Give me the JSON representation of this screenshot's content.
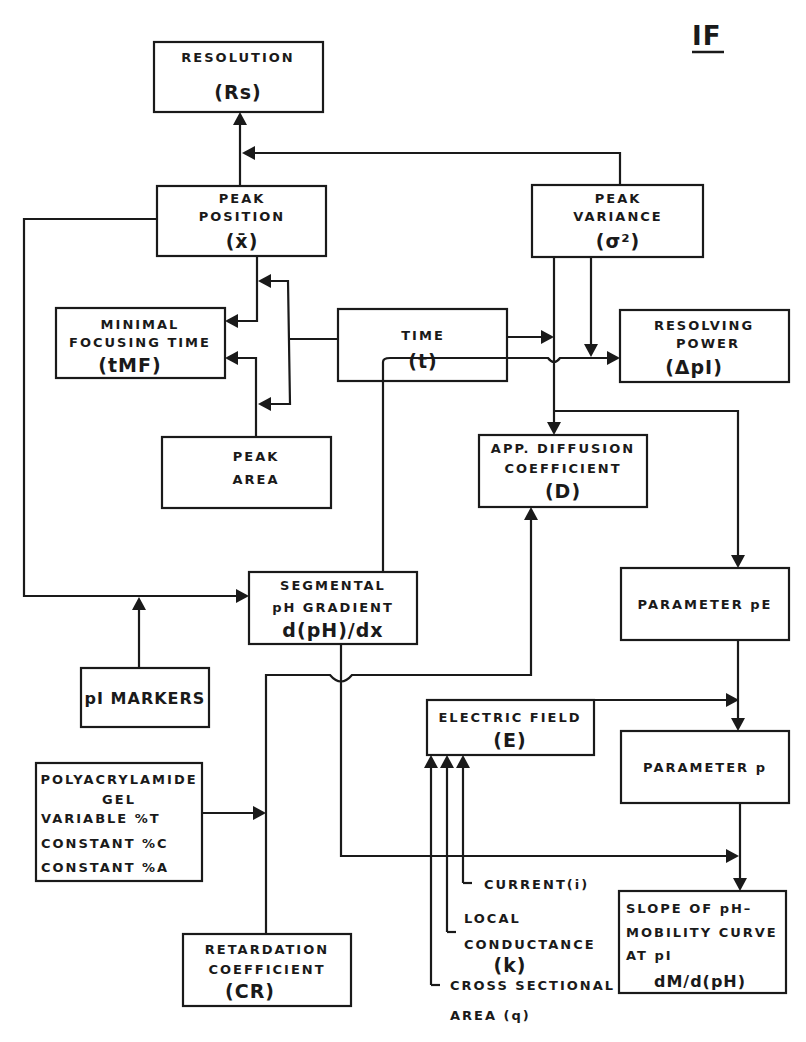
{
  "figure_label": "IF",
  "nodes": {
    "resolution": {
      "lines": [
        "RESOLUTION"
      ],
      "symbol": "(Rs)"
    },
    "peak_position": {
      "lines": [
        "PEAK",
        "POSITION"
      ],
      "symbol": "(x̄)"
    },
    "peak_variance": {
      "lines": [
        "PEAK",
        "VARIANCE"
      ],
      "symbol": "(σ²)"
    },
    "minimal_focusing_time": {
      "lines": [
        "MINIMAL",
        "FOCUSING TIME"
      ],
      "symbol": "(tMF)"
    },
    "time": {
      "lines": [
        "TIME"
      ],
      "symbol": "(t)"
    },
    "resolving_power": {
      "lines": [
        "RESOLVING",
        "POWER"
      ],
      "symbol": "(ΔpI)"
    },
    "peak_area": {
      "lines": [
        "PEAK",
        "AREA"
      ]
    },
    "app_diffusion": {
      "lines": [
        "APP. DIFFUSION",
        "COEFFICIENT"
      ],
      "symbol": "(D)"
    },
    "segmental_ph": {
      "lines": [
        "SEGMENTAL",
        "pH GRADIENT"
      ],
      "symbol": "d(pH)/dx"
    },
    "parameter_pe": {
      "lines": [
        "PARAMETER  pE"
      ]
    },
    "pi_markers": {
      "lines": [
        "pI MARKERS"
      ]
    },
    "electric_field": {
      "lines": [
        "ELECTRIC FIELD"
      ],
      "symbol": "(E)"
    },
    "polyacrylamide": {
      "lines": [
        "POLYACRYLAMIDE",
        "GEL",
        "VARIABLE %T",
        "CONSTANT %C",
        "CONSTANT %A"
      ]
    },
    "parameter_p": {
      "lines": [
        "PARAMETER  p"
      ]
    },
    "slope": {
      "lines": [
        "SLOPE OF pH–",
        "MOBILITY CURVE",
        "AT pI",
        "dM/d(pH)"
      ]
    },
    "retardation": {
      "lines": [
        "RETARDATION",
        "COEFFICIENT"
      ],
      "symbol": "(CR)"
    }
  },
  "labels": {
    "current": "CURRENT(i)",
    "local_conductance": [
      "LOCAL",
      "CONDUCTANCE",
      "(k)"
    ],
    "cross_sectional": [
      "CROSS SECTIONAL",
      "AREA (q)"
    ]
  }
}
